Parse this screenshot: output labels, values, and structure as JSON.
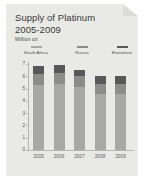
{
  "card": {
    "title_line1": "Supply of Platinum",
    "title_line2": "2005-2009",
    "subtitle": "Million oz"
  },
  "chart_data": {
    "type": "bar",
    "stacked": true,
    "title": "Supply of Platinum 2005-2009",
    "subtitle": "Million oz",
    "xlabel": "",
    "ylabel": "Million oz",
    "ylim": [
      0,
      7
    ],
    "yticks": [
      7,
      6,
      5,
      4,
      3,
      2,
      1,
      0
    ],
    "grid": false,
    "legend_position": "top",
    "categories": [
      "2005",
      "2006",
      "2007",
      "2008",
      "2009"
    ],
    "series": [
      {
        "name": "South Africa",
        "color": "#a8a8a4",
        "values": [
          5.3,
          5.4,
          5.1,
          4.6,
          4.6
        ]
      },
      {
        "name": "Russia",
        "color": "#8c8c88",
        "values": [
          0.9,
          0.9,
          0.9,
          0.8,
          0.8
        ]
      },
      {
        "name": "Elsewhere",
        "color": "#58585a",
        "values": [
          0.6,
          0.6,
          0.5,
          0.6,
          0.6
        ]
      }
    ],
    "totals": [
      6.8,
      6.9,
      6.5,
      6.0,
      6.0
    ]
  }
}
